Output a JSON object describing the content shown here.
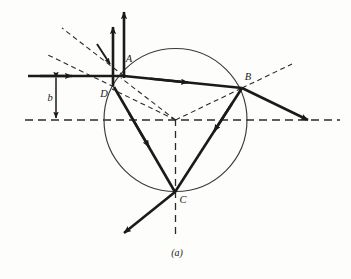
{
  "figure": {
    "caption": "(a)",
    "background_color": "#fdfdfb",
    "stroke_color": "#1a1a1a",
    "circle_color": "#3a3a3a",
    "dash_color": "#2a2a2a",
    "labels": {
      "A": "A",
      "B": "B",
      "C": "C",
      "D": "D",
      "impact_parameter": "b"
    },
    "geometry": {
      "circle_center_x": 175.5,
      "circle_center_y": 120,
      "circle_radius": 71.5,
      "point_A_x": 124,
      "point_A_y": 76,
      "point_D_x": 114,
      "point_D_y": 87,
      "point_B_x": 242,
      "point_B_y": 88,
      "point_C_x": 175,
      "point_C_y": 192,
      "axis_y": 120,
      "axis_x_start": 25,
      "axis_x_end": 340,
      "incoming_ray_y": 76,
      "incoming_ray_x_start": 28,
      "impact_parameter_x": 56
    },
    "elements": [
      "incident-ray",
      "refracted-ray-A-to-B",
      "internal-reflection-B-to-C",
      "internal-ray-C-to-A",
      "exit-ray-at-B",
      "exit-ray-at-C",
      "reflected-ray-at-A",
      "normal-at-A",
      "normal-at-B",
      "optical-axis",
      "raindrop-circle",
      "impact-parameter-marker"
    ]
  }
}
